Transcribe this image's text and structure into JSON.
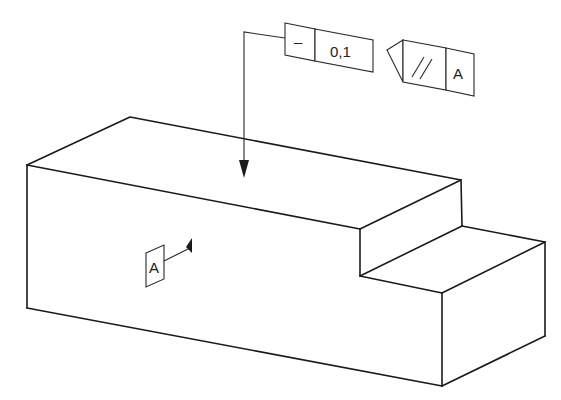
{
  "figure": {
    "type": "isometric-part-with-gdt-annotations",
    "part": {
      "name": "stepped block",
      "description": "Rectangular block with a step cut on the right end"
    },
    "annotations": {
      "straightness_frame": {
        "symbol": "–",
        "symbol_meaning": "straightness",
        "tolerance": "0,1"
      },
      "parallelism_frame": {
        "symbol": "//",
        "symbol_meaning": "parallelism",
        "datum": "A"
      },
      "datum_feature": {
        "label": "A"
      }
    },
    "colors": {
      "line": "#1a1a1a",
      "background": "#ffffff"
    }
  }
}
